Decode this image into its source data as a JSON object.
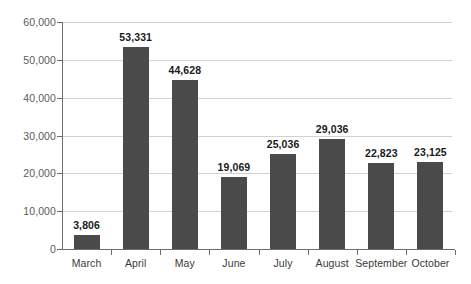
{
  "chart_data": {
    "type": "bar",
    "title": "",
    "subtitle": "",
    "xlabel": "",
    "ylabel": "",
    "categories": [
      "March",
      "April",
      "May",
      "June",
      "July",
      "August",
      "September",
      "October"
    ],
    "values": [
      3806,
      44628,
      44628,
      19069,
      25036,
      29036,
      22823,
      23125
    ],
    "value_labels": [
      "3,806",
      "53,331",
      "44,628",
      "19,069",
      "25,036",
      "29,036",
      "22,823",
      "23,125"
    ],
    "series": [
      {
        "name": "",
        "values": [
          3806,
          53331,
          44628,
          19069,
          25036,
          29036,
          22823,
          23125
        ]
      }
    ],
    "ylim": [
      0,
      60000
    ],
    "ytick_values": [
      0,
      10000,
      20000,
      30000,
      40000,
      50000,
      60000
    ],
    "ytick_labels": [
      "0",
      "10,000",
      "20,000",
      "30,000",
      "40,000",
      "50,000",
      "60,000"
    ],
    "grid": true,
    "grid_axis": "y",
    "legend": false,
    "legend_position": "none",
    "bar_color": "#4a4a4a",
    "gridline_color": "#d2d2d2",
    "axis_color": "#6d6d6d",
    "value_label_color": "#1a1a1a",
    "tick_label_color": "#5b5b5b",
    "category_label_color": "#3a3a3a",
    "background_color": "#ffffff",
    "annotations": []
  }
}
